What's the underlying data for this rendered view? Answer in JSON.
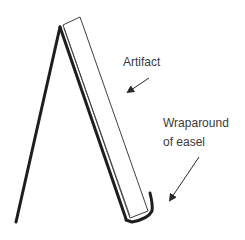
{
  "diagram": {
    "type": "easel-illustration",
    "labels": {
      "artifact": "Artifact",
      "wraparound_line1": "Wraparound",
      "wraparound_line2": "of easel"
    },
    "colors": {
      "stroke": "#1e1e1e",
      "text": "#3a3a3a",
      "background": "#ffffff"
    }
  }
}
